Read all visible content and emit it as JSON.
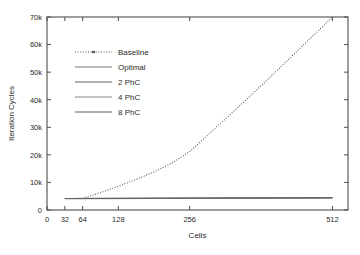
{
  "chart_data": {
    "type": "line",
    "title": "",
    "xlabel": "Cells",
    "ylabel": "Iteration Cycles",
    "xlim": [
      0,
      540
    ],
    "ylim": [
      0,
      70000
    ],
    "grid": false,
    "legend_position": "upper-left-inside",
    "x_tick_values": [
      0,
      32,
      64,
      128,
      256,
      512
    ],
    "x_tick_labels": [
      "0",
      "32",
      "64",
      "128",
      "256",
      "512"
    ],
    "y_tick_values": [
      0,
      10000,
      20000,
      30000,
      40000,
      50000,
      60000,
      70000
    ],
    "y_tick_labels": [
      "0",
      "10k",
      "20k",
      "30k",
      "40k",
      "50k",
      "60k",
      "70k"
    ],
    "series": [
      {
        "name": "Baseline",
        "style": "dotted",
        "color": "#555555",
        "x": [
          64,
          96,
          128,
          160,
          192,
          224,
          256,
          320,
          384,
          448,
          512
        ],
        "values": [
          4200,
          6300,
          8600,
          11100,
          13800,
          17000,
          21200,
          33000,
          45000,
          57500,
          70000
        ]
      },
      {
        "name": "Optimal",
        "style": "solid",
        "color": "#777777",
        "x": [
          32,
          512
        ],
        "values": [
          4100,
          4400
        ]
      },
      {
        "name": "2 PhC",
        "style": "solid",
        "color": "#666666",
        "x": [
          32,
          512
        ],
        "values": [
          4150,
          4420
        ]
      },
      {
        "name": "4 PhC",
        "style": "solid",
        "color": "#888888",
        "x": [
          32,
          512
        ],
        "values": [
          4180,
          4440
        ]
      },
      {
        "name": "8 PhC",
        "style": "solid",
        "color": "#606060",
        "x": [
          32,
          512
        ],
        "values": [
          4200,
          4460
        ]
      }
    ]
  },
  "legend": {
    "items": [
      {
        "label": "Baseline",
        "style": "dotted",
        "color": "#555555"
      },
      {
        "label": "Optimal",
        "style": "solid",
        "color": "#777777"
      },
      {
        "label": "2 PhC",
        "style": "solid",
        "color": "#666666"
      },
      {
        "label": "4 PhC",
        "style": "solid",
        "color": "#888888"
      },
      {
        "label": "8 PhC",
        "style": "solid",
        "color": "#606060"
      }
    ]
  },
  "colors": {
    "axis": "#4d4d4d",
    "text": "#2b2b2b",
    "background": "#ffffff"
  }
}
